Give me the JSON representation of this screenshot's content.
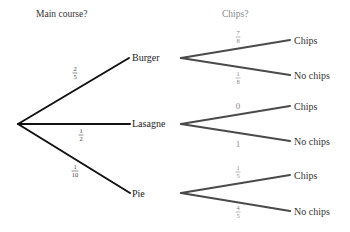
{
  "headers": {
    "level1": "Main course?",
    "level2": "Chips?"
  },
  "colors": {
    "level1_line": "#111111",
    "level2_line": "#4a4a4a",
    "header1_text": "#333333",
    "header2_text": "#888888",
    "prob1_text": "#444444",
    "prob2_text": "#888888"
  },
  "tree": {
    "root": "start",
    "branches": [
      {
        "label": "Burger",
        "probability": {
          "num": "2",
          "den": "5"
        },
        "children": [
          {
            "label": "Chips",
            "probability": {
              "num": "7",
              "den": "8"
            }
          },
          {
            "label": "No chips",
            "probability": {
              "num": "1",
              "den": "8"
            }
          }
        ]
      },
      {
        "label": "Lasagne",
        "probability": {
          "num": "1",
          "den": "2"
        },
        "children": [
          {
            "label": "Chips",
            "probability": {
              "whole": "0"
            }
          },
          {
            "label": "No chips",
            "probability": {
              "whole": "1"
            }
          }
        ]
      },
      {
        "label": "Pie",
        "probability": {
          "num": "1",
          "den": "10"
        },
        "children": [
          {
            "label": "Chips",
            "probability": {
              "num": "1",
              "den": "5"
            }
          },
          {
            "label": "No chips",
            "probability": {
              "num": "4",
              "den": "5"
            }
          }
        ]
      }
    ]
  }
}
